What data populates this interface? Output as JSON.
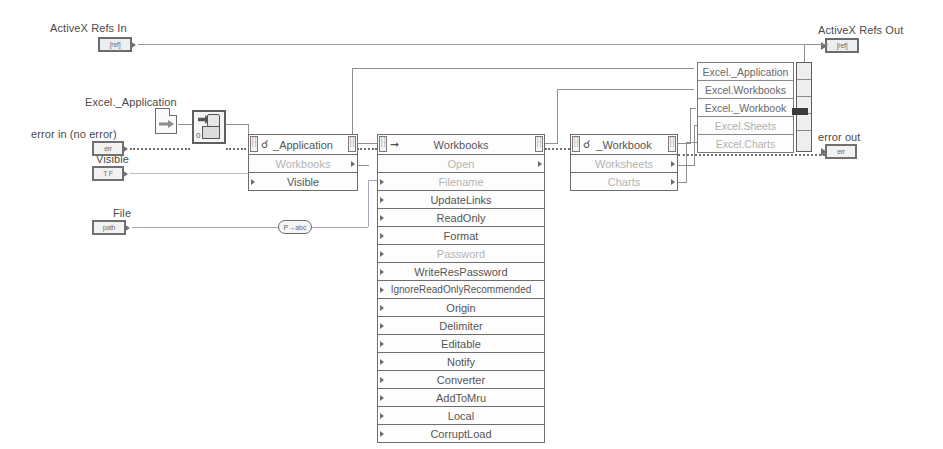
{
  "diagram": {
    "background": "#ffffff",
    "wire_color": "#8f8f8f",
    "error_wire_color": "#6e6e6e",
    "label_color": "#4a4a4a"
  },
  "labels": {
    "activex_refs_in": "ActiveX Refs In",
    "activex_refs_out": "ActiveX Refs Out",
    "excel_application": "Excel._Application",
    "error_in": "error in (no error)",
    "error_out": "error out",
    "visible": "Visible",
    "file": "File"
  },
  "terminals": {
    "refs_in": {
      "name": "activex-refs-in-terminal",
      "glyph": "[ref]"
    },
    "refs_out": {
      "name": "activex-refs-out-terminal",
      "glyph": "[ref]"
    },
    "error_in": {
      "name": "error-in-terminal",
      "glyph": "err"
    },
    "error_out": {
      "name": "error-out-terminal",
      "glyph": "err"
    },
    "visible": {
      "name": "visible-terminal",
      "glyph": "T F"
    },
    "file": {
      "name": "file-path-terminal",
      "glyph": "path"
    }
  },
  "nodes": {
    "application": {
      "header": "_Application",
      "kind_icon": "property-node-icon",
      "rows": [
        {
          "label": "Workbooks",
          "dim": true,
          "in": false,
          "out": true
        },
        {
          "label": "Visible",
          "dim": false,
          "in": true,
          "out": false
        }
      ]
    },
    "workbooks": {
      "header": "Workbooks",
      "kind_icon": "invoke-node-icon",
      "rows": [
        {
          "label": "Open",
          "dim": true,
          "in": false,
          "out": true
        },
        {
          "label": "Filename",
          "dim": true,
          "in": true,
          "out": false
        },
        {
          "label": "UpdateLinks",
          "dim": false,
          "in": true,
          "out": false
        },
        {
          "label": "ReadOnly",
          "dim": false,
          "in": true,
          "out": false
        },
        {
          "label": "Format",
          "dim": false,
          "in": true,
          "out": false
        },
        {
          "label": "Password",
          "dim": true,
          "in": true,
          "out": false
        },
        {
          "label": "WriteResPassword",
          "dim": false,
          "in": true,
          "out": false
        },
        {
          "label": "IgnoreReadOnlyRecommended",
          "dim": false,
          "in": true,
          "out": false
        },
        {
          "label": "Origin",
          "dim": false,
          "in": true,
          "out": false
        },
        {
          "label": "Delimiter",
          "dim": false,
          "in": true,
          "out": false
        },
        {
          "label": "Editable",
          "dim": false,
          "in": true,
          "out": false
        },
        {
          "label": "Notify",
          "dim": false,
          "in": true,
          "out": false
        },
        {
          "label": "Converter",
          "dim": false,
          "in": true,
          "out": false
        },
        {
          "label": "AddToMru",
          "dim": false,
          "in": true,
          "out": false
        },
        {
          "label": "Local",
          "dim": false,
          "in": true,
          "out": false
        },
        {
          "label": "CorruptLoad",
          "dim": false,
          "in": true,
          "out": false
        }
      ]
    },
    "workbook": {
      "header": "_Workbook",
      "kind_icon": "property-node-icon",
      "rows": [
        {
          "label": "Worksheets",
          "dim": true,
          "in": false,
          "out": true
        },
        {
          "label": "Charts",
          "dim": true,
          "in": false,
          "out": true
        }
      ]
    }
  },
  "class_list": {
    "name": "activex-class-list-constant",
    "items": [
      {
        "label": "Excel._Application",
        "dim": false
      },
      {
        "label": "Excel.Workbooks",
        "dim": false
      },
      {
        "label": "Excel._Workbook",
        "dim": false
      },
      {
        "label": "Excel.Sheets",
        "dim": true
      },
      {
        "label": "Excel.Charts",
        "dim": true
      }
    ]
  },
  "misc": {
    "automation_open": {
      "name": "automation-open-node",
      "glyph": "auto-open-icon"
    },
    "refnum_constant": {
      "name": "automation-refnum-constant",
      "glyph": "refnum-icon"
    },
    "path_to_string": {
      "name": "path-to-string-node",
      "glyph": "P→abc"
    },
    "array_builder": {
      "name": "build-array-node"
    }
  }
}
